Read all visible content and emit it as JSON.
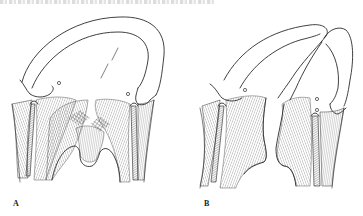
{
  "figure": {
    "panels": [
      {
        "id": "A",
        "label": "A"
      },
      {
        "id": "B",
        "label": "B"
      }
    ],
    "style": {
      "ink_color": "#2b2b2b",
      "background": "#ffffff"
    }
  }
}
